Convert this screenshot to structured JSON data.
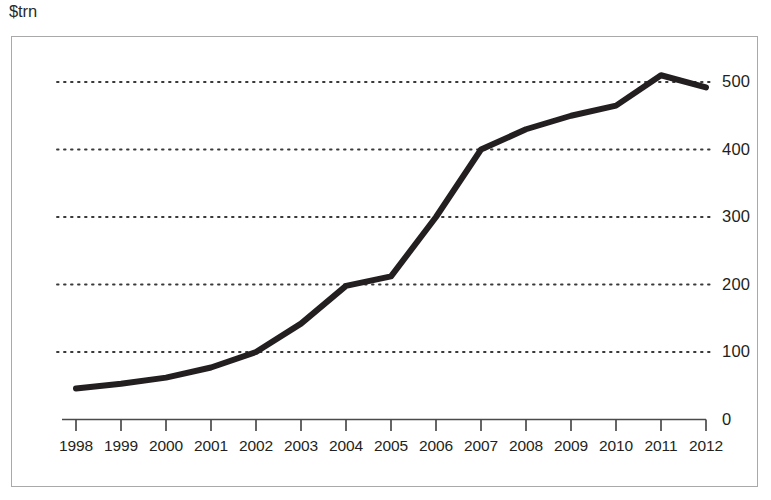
{
  "unit_label": "$trn",
  "chart_data": {
    "type": "line",
    "title": "",
    "subtitle": "",
    "xlabel": "",
    "ylabel": "$trn",
    "categories": [
      "1998",
      "1999",
      "2000",
      "2001",
      "2002",
      "2003",
      "2004",
      "2005",
      "2006",
      "2007",
      "2008",
      "2009",
      "2010",
      "2011",
      "2012"
    ],
    "values": [
      46,
      53,
      62,
      77,
      100,
      142,
      198,
      212,
      300,
      400,
      430,
      450,
      465,
      510,
      492
    ],
    "series": [
      {
        "name": "$trn",
        "values": [
          46,
          53,
          62,
          77,
          100,
          142,
          198,
          212,
          300,
          400,
          430,
          450,
          465,
          510,
          492
        ]
      }
    ],
    "ylim": [
      0,
      560
    ],
    "xlim_labels": [
      "1998",
      "2012"
    ],
    "y_ticks": [
      0,
      100,
      200,
      300,
      400,
      500
    ],
    "y_tick_labels": [
      "0",
      "100",
      "200",
      "300",
      "400",
      "500"
    ],
    "x_ticks": [
      "1998",
      "1999",
      "2000",
      "2001",
      "2002",
      "2003",
      "2004",
      "2005",
      "2006",
      "2007",
      "2008",
      "2009",
      "2010",
      "2011",
      "2012"
    ],
    "grid": "horizontal-dotted",
    "grid_color": "#3a3a3a",
    "legend": "none",
    "legend_position": "none",
    "line_color": "#231f20",
    "line_width": 6,
    "frame_color": "#a9a9a9",
    "background_color": "#ffffff",
    "annotations": []
  }
}
